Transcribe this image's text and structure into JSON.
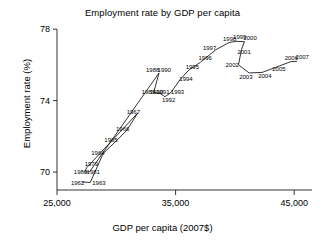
{
  "chart_data": {
    "type": "line",
    "title": "Employment rate by GDP per capita",
    "xlabel": "GDP per capita (2007$)",
    "ylabel": "Employment rate (%)",
    "xlim": [
      25000,
      46500
    ],
    "ylim": [
      69.0,
      78.4
    ],
    "xticks": [
      25000,
      35000,
      45000
    ],
    "xtick_labels": [
      "25,000",
      "35,000",
      "45,000"
    ],
    "yticks": [
      70,
      74,
      78
    ],
    "ytick_labels": [
      "70",
      "74",
      "78"
    ],
    "grid": false,
    "legend": "none",
    "series_name": "Employment rate vs GDP per capita",
    "point_label_field": "year",
    "points": [
      {
        "year": "1962",
        "x": 27100,
        "y": 69.45
      },
      {
        "year": "1963",
        "x": 27800,
        "y": 69.42
      },
      {
        "year": "1979",
        "x": 27500,
        "y": 70.25
      },
      {
        "year": "1980",
        "x": 27350,
        "y": 70.0
      },
      {
        "year": "1981",
        "x": 27750,
        "y": 70.02
      },
      {
        "year": "1964",
        "x": 28900,
        "y": 71.05
      },
      {
        "year": "1965",
        "x": 30000,
        "y": 71.75
      },
      {
        "year": "1966",
        "x": 30900,
        "y": 72.35
      },
      {
        "year": "1967",
        "x": 31800,
        "y": 73.3
      },
      {
        "year": "1989",
        "x": 33150,
        "y": 74.45
      },
      {
        "year": "1990",
        "x": 33500,
        "y": 74.42
      },
      {
        "year": "1991",
        "x": 33700,
        "y": 74.4
      },
      {
        "year": "1992",
        "x": 34100,
        "y": 74.22
      },
      {
        "year": "1993",
        "x": 34600,
        "y": 74.45
      },
      {
        "year": "1988",
        "x": 33600,
        "y": 75.55
      },
      {
        "year": "1990b",
        "x": 33900,
        "y": 75.55
      },
      {
        "year": "1994",
        "x": 35400,
        "y": 75.2
      },
      {
        "year": "1995",
        "x": 36100,
        "y": 75.7
      },
      {
        "year": "1996",
        "x": 37100,
        "y": 76.15
      },
      {
        "year": "1997",
        "x": 38400,
        "y": 76.85
      },
      {
        "year": "1998",
        "x": 39500,
        "y": 77.25
      },
      {
        "year": "1999",
        "x": 40100,
        "y": 77.32
      },
      {
        "year": "2000",
        "x": 40800,
        "y": 77.3
      },
      {
        "year": "2001",
        "x": 40550,
        "y": 76.85
      },
      {
        "year": "2002",
        "x": 40300,
        "y": 76.0
      },
      {
        "year": "2003",
        "x": 41200,
        "y": 75.55
      },
      {
        "year": "2004",
        "x": 42300,
        "y": 75.58
      },
      {
        "year": "2005",
        "x": 43400,
        "y": 75.85
      },
      {
        "year": "2006",
        "x": 44700,
        "y": 76.18
      },
      {
        "year": "2007",
        "x": 45200,
        "y": 76.2
      }
    ],
    "path_order": [
      "1962",
      "1963",
      "1964",
      "1965",
      "1966",
      "1967",
      "1979",
      "1980",
      "1981",
      "1988",
      "1989",
      "1990",
      "1991",
      "1992",
      "1993",
      "1994",
      "1995",
      "1996",
      "1997",
      "1998",
      "1999",
      "2000",
      "2001",
      "2002",
      "2003",
      "2004",
      "2005",
      "2006",
      "2007"
    ],
    "labels": [
      {
        "text": "1962",
        "x": 27100,
        "y": 69.45,
        "dx": -11,
        "dy": 3
      },
      {
        "text": "1963",
        "x": 27800,
        "y": 69.42,
        "dx": 2,
        "dy": 3
      },
      {
        "text": "1979",
        "x": 27500,
        "y": 70.25,
        "dx": -2,
        "dy": -2
      },
      {
        "text": "1980",
        "x": 27350,
        "y": 70.0,
        "dx": -11,
        "dy": 2
      },
      {
        "text": "1981",
        "x": 27750,
        "y": 70.02,
        "dx": -3,
        "dy": 2
      },
      {
        "text": "1964",
        "x": 28900,
        "y": 71.05,
        "dx": -12,
        "dy": 2
      },
      {
        "text": "1965",
        "x": 30000,
        "y": 71.75,
        "dx": -12,
        "dy": 1
      },
      {
        "text": "1966",
        "x": 30900,
        "y": 72.35,
        "dx": -11,
        "dy": 1
      },
      {
        "text": "1967",
        "x": 31800,
        "y": 73.3,
        "dx": -11,
        "dy": 1
      },
      {
        "text": "1989",
        "x": 33150,
        "y": 74.45,
        "dx": -12,
        "dy": 1
      },
      {
        "text": "1990",
        "x": 33500,
        "y": 74.42,
        "dx": -8,
        "dy": 1
      },
      {
        "text": "1991",
        "x": 33700,
        "y": 74.4,
        "dx": -4,
        "dy": 1
      },
      {
        "text": "1992",
        "x": 34100,
        "y": 74.22,
        "dx": -3,
        "dy": 5
      },
      {
        "text": "1993",
        "x": 34600,
        "y": 74.45,
        "dx": 0,
        "dy": 1
      },
      {
        "text": "1988",
        "x": 33600,
        "y": 75.55,
        "dx": -13,
        "dy": -1
      },
      {
        "text": "1990",
        "x": 33900,
        "y": 75.55,
        "dx": -5,
        "dy": -1
      },
      {
        "text": "1994",
        "x": 35400,
        "y": 75.2,
        "dx": -1,
        "dy": 2
      },
      {
        "text": "1995",
        "x": 36100,
        "y": 75.7,
        "dx": -3,
        "dy": -1
      },
      {
        "text": "1996",
        "x": 37100,
        "y": 76.15,
        "dx": -2,
        "dy": -2
      },
      {
        "text": "1997",
        "x": 38400,
        "y": 76.85,
        "dx": -13,
        "dy": 0
      },
      {
        "text": "1998",
        "x": 39500,
        "y": 77.25,
        "dx": -6,
        "dy": -2
      },
      {
        "text": "1999",
        "x": 40100,
        "y": 77.32,
        "dx": -3,
        "dy": -2
      },
      {
        "text": "2000",
        "x": 40800,
        "y": 77.3,
        "dx": -1,
        "dy": -2
      },
      {
        "text": "2001",
        "x": 40550,
        "y": 76.85,
        "dx": -4,
        "dy": 4
      },
      {
        "text": "2002",
        "x": 40300,
        "y": 76.0,
        "dx": -13,
        "dy": 2
      },
      {
        "text": "2003",
        "x": 41200,
        "y": 75.55,
        "dx": -10,
        "dy": 6
      },
      {
        "text": "2004",
        "x": 42300,
        "y": 75.58,
        "dx": -4,
        "dy": 6
      },
      {
        "text": "2005",
        "x": 43400,
        "y": 75.85,
        "dx": -3,
        "dy": 3
      },
      {
        "text": "2006",
        "x": 44700,
        "y": 76.18,
        "dx": -6,
        "dy": -2
      },
      {
        "text": "2007",
        "x": 45200,
        "y": 76.2,
        "dx": -1,
        "dy": -2
      }
    ]
  }
}
